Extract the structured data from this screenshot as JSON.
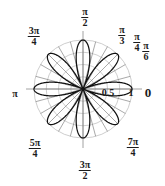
{
  "figure": {
    "type": "polar-plot",
    "background_color": "#ffffff",
    "curve_color": "#111111",
    "grid_color": "#b9b9b9",
    "spoke_color": "#6e6e6e",
    "axis_color": "#8a8a8a",
    "text_color": "#1b1b1b"
  },
  "angle_labels": [
    {
      "name": "angle-0",
      "text": "0",
      "kind": "plain",
      "num": "0",
      "den": "",
      "x": 148,
      "y": 86,
      "size": "sz-zero"
    },
    {
      "name": "angle-pi-6",
      "text": "π/6",
      "kind": "frac",
      "num": "π",
      "den": "6",
      "x": 146,
      "y": 41,
      "size": "sz-ang"
    },
    {
      "name": "angle-pi-4",
      "text": "π/4",
      "kind": "frac",
      "num": "π",
      "den": "4",
      "x": 137,
      "y": 32,
      "size": "sz-ang"
    },
    {
      "name": "angle-pi-3",
      "text": "π/3",
      "kind": "frac",
      "num": "π",
      "den": "3",
      "x": 122,
      "y": 25,
      "size": "sz-ang"
    },
    {
      "name": "angle-pi-2",
      "text": "π/2",
      "kind": "frac",
      "num": "π",
      "den": "2",
      "x": 85,
      "y": 7,
      "size": "sz-ang"
    },
    {
      "name": "angle-3pi-4",
      "text": "3π/4",
      "kind": "frac",
      "num": "3π",
      "den": "4",
      "x": 34,
      "y": 26,
      "size": "sz-ang"
    },
    {
      "name": "angle-pi",
      "text": "π",
      "kind": "plain",
      "num": "π",
      "den": "",
      "x": 15,
      "y": 89,
      "size": "sz-pi"
    },
    {
      "name": "angle-5pi-4",
      "text": "5π/4",
      "kind": "frac",
      "num": "5π",
      "den": "4",
      "x": 35,
      "y": 138,
      "size": "sz-ang"
    },
    {
      "name": "angle-3pi-2",
      "text": "3π/2",
      "kind": "frac",
      "num": "3π",
      "den": "2",
      "x": 85,
      "y": 160,
      "size": "sz-ang"
    },
    {
      "name": "angle-7pi-4",
      "text": "7π/4",
      "kind": "frac",
      "num": "7π",
      "den": "4",
      "x": 133,
      "y": 137,
      "size": "sz-ang"
    }
  ],
  "radial_labels": [
    {
      "name": "radial-tick-0-5",
      "text": "0.5",
      "x": 108,
      "y": 88,
      "size": "sz-r"
    },
    {
      "name": "radial-tick-1",
      "text": "1",
      "x": 131,
      "y": 88,
      "size": "sz-r"
    }
  ],
  "chart_data": {
    "type": "line",
    "subtype": "polar-rose",
    "title": "",
    "xlabel": "",
    "ylabel": "",
    "equation": "r = cos(4θ)",
    "petal_count": 8,
    "petal_angles_deg": [
      90,
      135,
      180,
      225,
      247,
      270,
      315,
      0,
      45,
      22
    ],
    "rlim": [
      0,
      1
    ],
    "r_ticks": [
      0.25,
      0.5,
      0.75,
      1
    ],
    "r_tick_labels": [
      "",
      "0.5",
      "",
      "1"
    ],
    "theta_ticks_deg": [
      0,
      30,
      45,
      60,
      90,
      135,
      180,
      225,
      270,
      315
    ],
    "theta_tick_labels": [
      "0",
      "π/6",
      "π/4",
      "π/3",
      "π/2",
      "3π/4",
      "π",
      "5π/4",
      "3π/2",
      "7π/4"
    ],
    "grid": true,
    "legend": false,
    "center_px": {
      "x": 83,
      "y": 89
    },
    "radius_px": 49,
    "series": [
      {
        "name": "rose-curve",
        "color": "#111111",
        "samples_theta_deg": [
          0,
          11.25,
          22.5,
          33.75,
          45,
          56.25,
          67.5,
          78.75,
          90,
          101.25,
          112.5,
          123.75,
          135,
          146.25,
          157.5,
          168.75,
          180,
          191.25,
          202.5,
          213.75,
          225,
          236.25,
          247.5,
          258.75,
          270,
          281.25,
          292.5,
          303.75,
          315,
          326.25,
          337.5,
          348.75
        ],
        "samples_r": [
          1,
          0.707,
          0,
          -0.707,
          -1,
          -0.707,
          0,
          0.707,
          1,
          0.707,
          0,
          -0.707,
          -1,
          -0.707,
          0,
          0.707,
          1,
          0.707,
          0,
          -0.707,
          -1,
          -0.707,
          0,
          0.707,
          1,
          0.707,
          0,
          -0.707,
          -1,
          -0.707,
          0,
          0.707
        ]
      }
    ]
  }
}
